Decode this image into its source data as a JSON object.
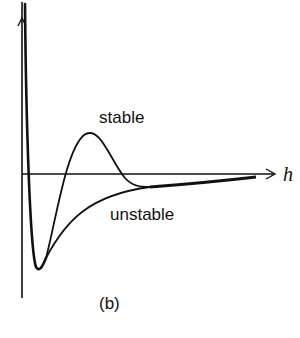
{
  "figure": {
    "caption": "(b)",
    "axis_x_label": "h",
    "curves": [
      {
        "name": "stable",
        "label": "stable"
      },
      {
        "name": "unstable",
        "label": "unstable"
      }
    ],
    "stroke_color": "#111111",
    "background": "#ffffff"
  }
}
